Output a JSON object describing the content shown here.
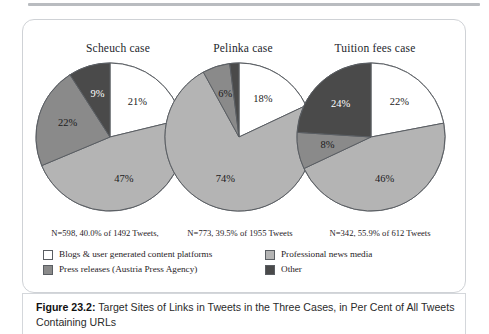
{
  "figure": {
    "caption_label": "Figure 23.2:",
    "caption_text": " Target Sites of Links in Tweets in the Three Cases, in Per Cent of All Tweets Containing URLs"
  },
  "colors": {
    "blogs_ugc": "#ffffff",
    "press_releases": "#8a8a8a",
    "professional_news": "#b4b4b4",
    "other": "#4a4a4a",
    "outline": "#5a5e63",
    "card_border": "#cfd2d6"
  },
  "legend": {
    "position": "bottom",
    "items": [
      {
        "label": "Blogs & user generated content platforms",
        "color": "#ffffff"
      },
      {
        "label": "Press releases (Austria Press Agency)",
        "color": "#8a8a8a"
      },
      {
        "label": "Professional news media",
        "color": "#b4b4b4"
      },
      {
        "label": "Other",
        "color": "#4a4a4a"
      }
    ]
  },
  "chart_data": {
    "type": "pie",
    "title": "Target Sites of Links in Tweets in the Three Cases, in Per Cent of All Tweets Containing URLs",
    "xlabel": "",
    "ylabel": "",
    "units": "per cent",
    "categories": [
      "Blogs & user generated content platforms",
      "Professional news media",
      "Press releases (Austria Press Agency)",
      "Other"
    ],
    "charts": [
      {
        "title": "Scheuch case",
        "n_label": "N=598, 40.0% of 1492 Tweets,",
        "n": 598,
        "share_of_tweets": 40.0,
        "total_tweets": 1492,
        "slices": [
          {
            "category": "Blogs & user generated content platforms",
            "value": 21,
            "label": "21%",
            "color": "#ffffff"
          },
          {
            "category": "Professional news media",
            "value": 47,
            "label": "47%",
            "color": "#b4b4b4"
          },
          {
            "category": "Press releases (Austria Press Agency)",
            "value": 22,
            "label": "22%",
            "color": "#8a8a8a"
          },
          {
            "category": "Other",
            "value": 9,
            "label": "9%",
            "color": "#4a4a4a"
          }
        ]
      },
      {
        "title": "Pelinka case",
        "n_label": "N=773, 39.5% of 1955 Tweets",
        "n": 773,
        "share_of_tweets": 39.5,
        "total_tweets": 1955,
        "slices": [
          {
            "category": "Blogs & user generated content platforms",
            "value": 18,
            "label": "18%",
            "color": "#ffffff"
          },
          {
            "category": "Professional news media",
            "value": 74,
            "label": "74%",
            "color": "#b4b4b4"
          },
          {
            "category": "Press releases (Austria Press Agency)",
            "value": 6,
            "label": "6%",
            "color": "#8a8a8a"
          },
          {
            "category": "Other",
            "value": 2,
            "label": "",
            "color": "#4a4a4a"
          }
        ]
      },
      {
        "title": "Tuition fees case",
        "n_label": "N=342, 55.9% of 612 Tweets",
        "n": 342,
        "share_of_tweets": 55.9,
        "total_tweets": 612,
        "slices": [
          {
            "category": "Blogs & user generated content platforms",
            "value": 22,
            "label": "22%",
            "color": "#ffffff"
          },
          {
            "category": "Professional news media",
            "value": 46,
            "label": "46%",
            "color": "#b4b4b4"
          },
          {
            "category": "Press releases (Austria Press Agency)",
            "value": 8,
            "label": "8%",
            "color": "#8a8a8a"
          },
          {
            "category": "Other",
            "value": 24,
            "label": "24%",
            "color": "#4a4a4a"
          }
        ]
      }
    ]
  }
}
